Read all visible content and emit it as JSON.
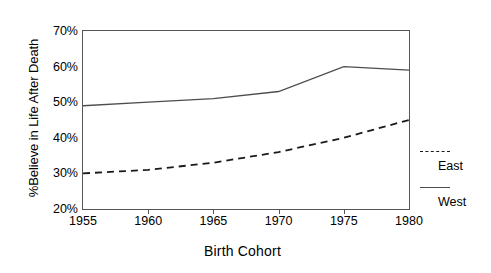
{
  "chart_data": {
    "type": "line",
    "title": "",
    "xlabel": "Birth Cohort",
    "ylabel": "%Believe in Life After Death",
    "x": [
      1955,
      1960,
      1965,
      1970,
      1975,
      1980
    ],
    "xlim": [
      1955,
      1980
    ],
    "ylim": [
      20,
      70
    ],
    "xticks": [
      "1955",
      "1960",
      "1965",
      "1970",
      "1975",
      "1980"
    ],
    "yticks": [
      "20%",
      "30%",
      "40%",
      "50%",
      "60%",
      "70%"
    ],
    "ytick_values": [
      20,
      30,
      40,
      50,
      60,
      70
    ],
    "grid": false,
    "legend_position": "right-outside",
    "series": [
      {
        "name": "East",
        "style": "dashed",
        "color": "#1a1a1a",
        "values": [
          30,
          31,
          33,
          36,
          40,
          45
        ]
      },
      {
        "name": "West",
        "style": "solid",
        "color": "#4d4d4d",
        "values": [
          49,
          50,
          51,
          53,
          60,
          59
        ]
      }
    ]
  },
  "legend": {
    "entries": [
      {
        "label": "East",
        "style": "dashed"
      },
      {
        "label": "West",
        "style": "solid"
      }
    ]
  },
  "colors": {
    "axis": "#555555",
    "east_line": "#1a1a1a",
    "west_line": "#4d4d4d",
    "background": "#ffffff"
  }
}
